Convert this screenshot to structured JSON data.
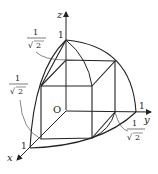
{
  "figure": {
    "axes": {
      "x_label": "x",
      "y_label": "y",
      "z_label": "z",
      "origin_label": "O"
    },
    "tick_labels": {
      "x_one": "1",
      "y_one": "1",
      "z_one": "1"
    },
    "callouts": {
      "z_value": {
        "numerator": "1",
        "denominator": "2",
        "radical": "√"
      },
      "x_value": {
        "numerator": "1",
        "denominator": "2",
        "radical": "√"
      },
      "y_value": {
        "numerator": "1",
        "denominator": "2",
        "radical": "√"
      }
    },
    "colors": {
      "line": "#222222",
      "callout": "#555555"
    }
  }
}
